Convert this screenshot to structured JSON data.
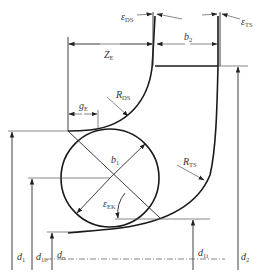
{
  "diagram": {
    "labels": {
      "eps_ds": {
        "main": "ε",
        "sub": "DS"
      },
      "eps_ts": {
        "main": "ε",
        "sub": "TS"
      },
      "ze": {
        "main": "Z",
        "sub": "E"
      },
      "b2": {
        "main": "b",
        "sub": "2"
      },
      "ge": {
        "main": "g",
        "sub": "E"
      },
      "rds": {
        "main": "R",
        "sub": "DS"
      },
      "b1": {
        "main": "b",
        "sub": "1"
      },
      "rts": {
        "main": "R",
        "sub": "TS"
      },
      "eps_ek": {
        "main": "ε",
        "sub": "EK"
      },
      "d1": {
        "main": "d",
        "sub": "1"
      },
      "d1b": {
        "main": "d",
        "sub": "1b"
      },
      "dn": {
        "main": "d",
        "sub": "n"
      },
      "d1i": {
        "main": "d",
        "sub": "1i"
      },
      "d2": {
        "main": "d",
        "sub": "2"
      }
    },
    "colors": {
      "line": "#2a2a2a",
      "background": "#ffffff",
      "text": "#333333"
    }
  }
}
